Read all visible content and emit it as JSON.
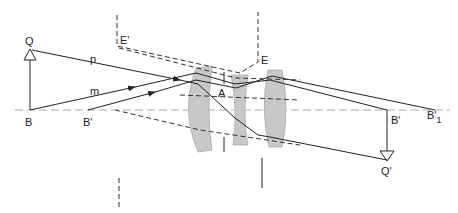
{
  "diagram": {
    "type": "optical-ray-diagram",
    "labels": {
      "Q": "Q",
      "B": "B",
      "B_prime": "B'",
      "p": "p",
      "m": "m",
      "E": "E",
      "E_prime": "E'",
      "A": "A",
      "B_prime_img": "B'",
      "B_prime_1": "B'",
      "B_prime_1_sub": "1",
      "Q_prime": "Q'"
    },
    "colors": {
      "ray": "#222222",
      "axis": "#aaaaaa",
      "lens_fill": "#c8c8c8"
    }
  }
}
